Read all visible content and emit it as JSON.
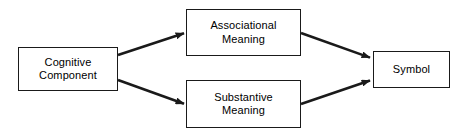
{
  "diagram": {
    "type": "flow-diagram",
    "background_color": "#ffffff",
    "stroke_color": "#1a1a1a",
    "text_color": "#000000",
    "nodes": [
      {
        "id": "cognitive-component",
        "lines": [
          "Cognitive",
          "Component"
        ],
        "shape": "rectangle",
        "x": 18,
        "y": 47,
        "width": 100,
        "height": 44
      },
      {
        "id": "associational-meaning",
        "lines": [
          "Associational",
          "Meaning"
        ],
        "shape": "rectangle",
        "x": 186,
        "y": 9,
        "width": 115,
        "height": 47
      },
      {
        "id": "substantive-meaning",
        "lines": [
          "Substantive",
          "Meaning"
        ],
        "shape": "rectangle",
        "x": 186,
        "y": 80,
        "width": 115,
        "height": 48
      },
      {
        "id": "symbol",
        "lines": [
          "Symbol"
        ],
        "shape": "rectangle",
        "x": 373,
        "y": 51,
        "width": 77,
        "height": 37
      }
    ],
    "edges": [
      {
        "id": "cognitive-to-associational",
        "from": "cognitive-component",
        "to": "associational-meaning",
        "label": "",
        "arrowhead": "filled-triangle",
        "x1": 118,
        "y1": 55,
        "x2": 185,
        "y2": 33
      },
      {
        "id": "cognitive-to-substantive",
        "from": "cognitive-component",
        "to": "substantive-meaning",
        "label": "",
        "arrowhead": "filled-triangle",
        "x1": 118,
        "y1": 80,
        "x2": 185,
        "y2": 104
      },
      {
        "id": "associational-to-symbol",
        "from": "associational-meaning",
        "to": "symbol",
        "label": "",
        "arrowhead": "filled-triangle",
        "x1": 301,
        "y1": 33,
        "x2": 371,
        "y2": 58
      },
      {
        "id": "substantive-to-symbol",
        "from": "substantive-meaning",
        "to": "symbol",
        "label": "",
        "arrowhead": "filled-triangle",
        "x1": 301,
        "y1": 104,
        "x2": 371,
        "y2": 80
      }
    ]
  }
}
